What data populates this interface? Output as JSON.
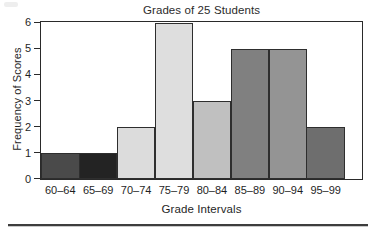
{
  "chart_data": {
    "type": "bar",
    "title": "Grades of 25 Students",
    "xlabel": "Grade Intervals",
    "ylabel": "Frequency of Scores",
    "categories": [
      "60–64",
      "65–69",
      "70–74",
      "75–79",
      "80–84",
      "85–89",
      "90–94",
      "95–99"
    ],
    "values": [
      1,
      1,
      2,
      6,
      3,
      5,
      5,
      2
    ],
    "bar_colors": [
      "#4a4a4a",
      "#232323",
      "#dcdcdc",
      "#dedede",
      "#c0c0c0",
      "#808080",
      "#949494",
      "#6e6e6e"
    ],
    "bar_border_color": "#2e2e2e",
    "ylim": [
      0,
      6
    ],
    "yticks": [
      0,
      1,
      2,
      3,
      4,
      5,
      6
    ],
    "ytick_labels": [
      "0",
      "1",
      "2",
      "3",
      "4",
      "5",
      "6"
    ],
    "grid": false,
    "legend": "none",
    "total_students": 25,
    "bars_touching": true
  },
  "figure": {
    "background_color": "#ffffff",
    "frame_color": "#2a2a2a",
    "text_color": "#1f1f1f",
    "divider_color": "#3d3d3d"
  }
}
